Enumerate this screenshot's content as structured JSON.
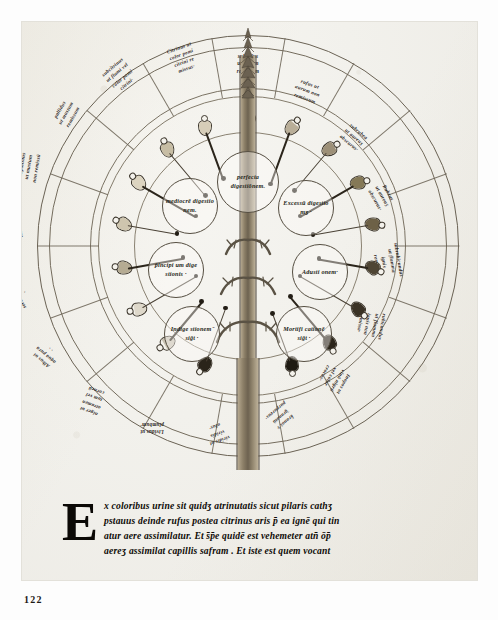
{
  "plate": {
    "caption_folio": "122",
    "title": "Rota urinarum — urine wheel with tree",
    "ink_color": "#2a241c",
    "parchment_color": "#f2f1ec"
  },
  "wheel": {
    "center_nodes": [
      {
        "id": "perfecta",
        "label": "perfecta digestiōnem."
      },
      {
        "id": "mediocrem",
        "label": "mediocrē digestio nem."
      },
      {
        "id": "excessum",
        "label": "Excessū digestio\nmʒ ·"
      },
      {
        "id": "principium",
        "label": "p̄incipi um dige stionis ·"
      },
      {
        "id": "adustio",
        "label": "Adusti onem·"
      },
      {
        "id": "indigestio",
        "label": "Indige stionem ̄ siḡt ·"
      },
      {
        "id": "mortificatio",
        "label": "Mortifi cationē siḡt ·"
      }
    ],
    "outer_labels": [
      {
        "idx": 0,
        "lines": [
          "subrufus",
          "ut aurum",
          "remissum"
        ]
      },
      {
        "idx": 1,
        "lines": [
          "rufus ut",
          "aurum non",
          "remissum"
        ]
      },
      {
        "idx": 2,
        "lines": [
          "subrubea",
          "ut aureuʒ",
          "obscurus·"
        ]
      },
      {
        "idx": 3,
        "lines": [
          "Rubeus",
          "ut aureuʒ",
          "obscurus·"
        ]
      },
      {
        "idx": 4,
        "lines": [
          "subrubicundus",
          "ut flamma",
          "ignis",
          "remissa"
        ]
      },
      {
        "idx": 5,
        "lines": [
          "rubicundus",
          "ut flamma",
          "ignis non",
          "remissa·"
        ]
      },
      {
        "idx": 6,
        "lines": [
          "Inopos ut",
          "vinū nigrū",
          "vel color",
          "crocus·"
        ]
      },
      {
        "idx": 7,
        "lines": [
          "k̄ranos̄ v̄",
          "̄granatū",
          "purpureus·"
        ]
      },
      {
        "idx": 8,
        "lines": [
          "viridis ut",
          "viridis",
          "olus·"
        ]
      },
      {
        "idx": 9,
        "lines": [
          "Lividus ut",
          "plumbum·"
        ]
      },
      {
        "idx": 10,
        "lines": [
          "niger ut",
          "atramen",
          "tum vel",
          "corneū"
        ]
      },
      {
        "idx": 11,
        "lines": [
          "Albus ut",
          "aqua pura",
          "· ·"
        ]
      },
      {
        "idx": 12,
        "lines": [
          "Lacteus ut",
          "serum lactis",
          "·"
        ]
      },
      {
        "idx": 13,
        "lines": [
          "Karapos",
          "ut pilus",
          "cameli·"
        ]
      },
      {
        "idx": 14,
        "lines": [
          "subpallidus",
          "ut mustum",
          "non remissū"
        ]
      },
      {
        "idx": 15,
        "lines": [
          "pallidus",
          "ut mustum",
          "remissum"
        ]
      },
      {
        "idx": 16,
        "lines": [
          "subcitrinus",
          "ut flumi vel",
          "color pomi",
          "citrini·"
        ]
      },
      {
        "idx": 17,
        "lines": [
          "Citrinus ut",
          "color pomi",
          "citrini re",
          "missus·"
        ]
      }
    ],
    "flask_count": 18
  },
  "paragraph": {
    "initial": "E",
    "lines": [
      "x coloribus urine sit quidʒ atrinutatis sicut pilaris cathʒ",
      "pstauus deinde rufus postea citrinus aris p̄ ea ignē qui tin",
      "atur aere assimilatur. Et s̄p̄e quidē est vehemeter atn̄ ōp̄",
      "aereʒ assimilat capillis safram . Et iste est quem vocant"
    ]
  }
}
